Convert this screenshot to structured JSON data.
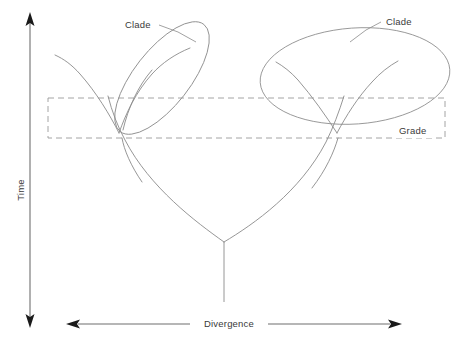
{
  "figure": {
    "kind": "phylogenetic-tree-diagram",
    "background_color": "#ffffff",
    "line_color": "#8a8a8a",
    "text_color": "#3a3a3a",
    "dash_color": "#9a9a9a"
  },
  "axes": {
    "vertical": {
      "label": "Time",
      "orientation": "vertical",
      "arrow_style": "double-headed",
      "x": 30,
      "y_top": 14,
      "y_bottom": 326
    },
    "horizontal": {
      "label": "Divergence",
      "orientation": "horizontal",
      "arrow_style": "double-headed",
      "y": 324,
      "x_left": 68,
      "x_right": 400
    }
  },
  "annotations": {
    "clade_left": {
      "label": "Clade",
      "text_x": 127,
      "text_y": 28,
      "leader_from": [
        159,
        25
      ],
      "leader_to": [
        190,
        40
      ]
    },
    "clade_right": {
      "label": "Clade",
      "text_x": 382,
      "text_y": 25,
      "leader_from": [
        379,
        22
      ],
      "leader_to": [
        352,
        40
      ]
    },
    "grade": {
      "label": "Grade",
      "text_x": 400,
      "text_y": 133
    }
  },
  "grade_band": {
    "label": "Grade",
    "x": 48,
    "y": 98,
    "width": 397,
    "height": 40,
    "style": "dashed-rectangle"
  },
  "clades": [
    {
      "name": "clade-left",
      "shape": "ellipse",
      "cx": 162,
      "cy": 78,
      "rx": 68,
      "ry": 28,
      "rotation_deg": -52
    },
    {
      "name": "clade-right",
      "shape": "ellipse",
      "cx": 355,
      "cy": 76,
      "rx": 95,
      "ry": 48,
      "rotation_deg": -4
    }
  ],
  "tree": {
    "root_stem": {
      "x": 224,
      "y_top": 242,
      "y_bottom": 302
    },
    "nodes": [
      {
        "name": "root",
        "x": 224,
        "y": 242
      },
      {
        "name": "left-split",
        "x": 119,
        "y": 133
      },
      {
        "name": "right-split",
        "x": 337,
        "y": 133
      }
    ],
    "branch_count": 6
  }
}
